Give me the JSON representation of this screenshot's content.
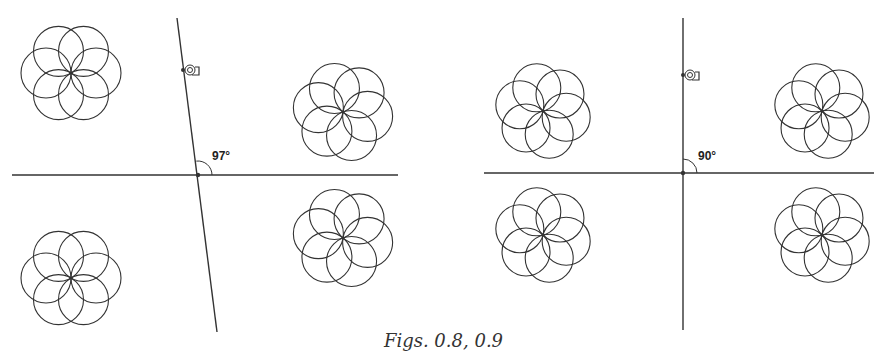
{
  "caption": "Figs. 0.8, 0.9",
  "panels": [
    {
      "name": "fig-0-8",
      "angle_label": "97°",
      "angle_deg": 97,
      "horizontal_line": {
        "x1": 12,
        "y1": 175,
        "x2": 398,
        "y2": 175
      },
      "transversal_line": {
        "x1": 177,
        "y1": 18,
        "x2": 217,
        "y2": 332
      },
      "intersection": {
        "x": 198,
        "y": 175
      },
      "handle_point": {
        "x": 183,
        "y": 70
      },
      "angle_label_pos": {
        "x": 212,
        "y": 160
      },
      "flowers": [
        {
          "cx": 71,
          "cy": 73,
          "r": 25,
          "rot": 0
        },
        {
          "cx": 343,
          "cy": 112,
          "r": 25,
          "rot": 10
        },
        {
          "cx": 71,
          "cy": 278,
          "r": 25,
          "rot": 0
        },
        {
          "cx": 343,
          "cy": 238,
          "r": 25,
          "rot": 10
        }
      ]
    },
    {
      "name": "fig-0-9",
      "angle_label": "90°",
      "angle_deg": 90,
      "horizontal_line": {
        "x1": 484,
        "y1": 173,
        "x2": 874,
        "y2": 173
      },
      "transversal_line": {
        "x1": 683,
        "y1": 18,
        "x2": 683,
        "y2": 330
      },
      "intersection": {
        "x": 683,
        "y": 173
      },
      "handle_point": {
        "x": 683,
        "y": 75
      },
      "angle_label_pos": {
        "x": 698,
        "y": 160
      },
      "flowers": [
        {
          "cx": 543,
          "cy": 111,
          "r": 24,
          "rot": 15
        },
        {
          "cx": 822,
          "cy": 111,
          "r": 24,
          "rot": 15
        },
        {
          "cx": 543,
          "cy": 235,
          "r": 24,
          "rot": 15
        },
        {
          "cx": 822,
          "cy": 235,
          "r": 24,
          "rot": 15
        }
      ]
    }
  ],
  "colors": {
    "stroke": "#333333",
    "background": "#ffffff"
  }
}
